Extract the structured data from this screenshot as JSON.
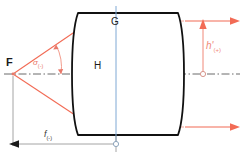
{
  "diagram": {
    "background": "#ffffff",
    "width": 244,
    "height": 164,
    "colors": {
      "lens_outline": "#111111",
      "ray_red": "#f26b55",
      "ray_dashed": "#f2a093",
      "axis_gray": "#6b6b6b",
      "principal_plane_blue": "#7fa8d4",
      "dimension_gray": "#9a9a9a",
      "label_black": "#1a1a1a",
      "marker_outline": "#cfa39c"
    },
    "labels": {
      "focal_point": "F",
      "principal_point_front": "G",
      "principal_point_rear": "H",
      "angle_sigma": "σ",
      "angle_sigma_sub": "(-)",
      "image_height": "h'",
      "image_height_sub": "(+)",
      "focal_length": "f",
      "focal_length_sub": "(-)"
    },
    "elements": {
      "optical_axis": "dash-dot horizontal center line",
      "lens": "thick biconvex lens with flat top and bottom edges",
      "principal_plane": "vertical blue line through G and H",
      "rays": "red marginal rays from F through lens emerging parallel to axis",
      "construction_lines": "salmon dashed lines from lens edges to principal plane",
      "height_arrow": "vertical red arrow marking image height h'",
      "focal_dimension": "gray dimension line from F to principal plane"
    }
  }
}
